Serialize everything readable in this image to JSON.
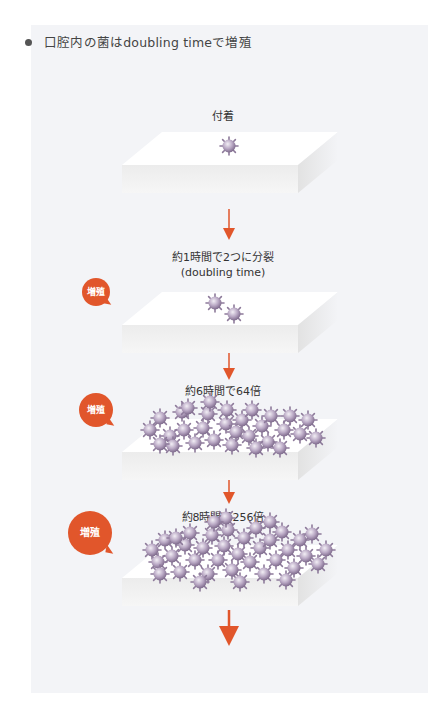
{
  "heading": {
    "text": "口腔内の菌はdoubling timeで増殖"
  },
  "accent_color": "#e1562b",
  "stages": [
    {
      "label": "付着",
      "bacteria_count_shown": 1
    },
    {
      "label": "約1時間で2つに分裂",
      "sublabel": "(doubling time)",
      "badge": "増殖",
      "bacteria_count_shown": 2
    },
    {
      "label": "約6時間で64倍",
      "badge": "増殖"
    },
    {
      "label": "約8時間で256倍",
      "badge": "増殖"
    }
  ]
}
